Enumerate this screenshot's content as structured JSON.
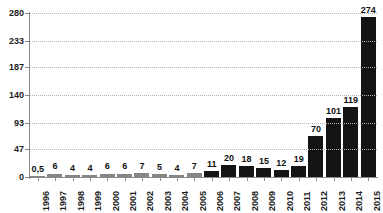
{
  "chart_data": {
    "type": "bar",
    "title": "",
    "xlabel": "",
    "ylabel": "",
    "ylim": [
      0,
      280
    ],
    "grid": true,
    "legend": "none",
    "yticks": [
      280,
      233,
      187,
      140,
      93,
      47,
      0
    ],
    "categories": [
      "1996",
      "1997",
      "1998",
      "1999",
      "2000",
      "2001",
      "2002",
      "2003",
      "2004",
      "2005",
      "2006",
      "2007",
      "2008",
      "2009",
      "2010",
      "2011",
      "2012",
      "2013",
      "2014",
      "2015"
    ],
    "values": [
      0.5,
      6,
      4,
      4,
      6,
      6,
      7,
      5,
      4,
      7,
      11,
      20,
      18,
      15,
      12,
      19,
      70,
      101,
      119,
      274
    ],
    "value_labels": [
      "0,5",
      "6",
      "4",
      "4",
      "6",
      "6",
      "7",
      "5",
      "4",
      "7",
      "11",
      "20",
      "18",
      "15",
      "12",
      "19",
      "70",
      "101",
      "119",
      "274"
    ],
    "bar_colors": [
      "#868686",
      "#868686",
      "#868686",
      "#868686",
      "#868686",
      "#868686",
      "#868686",
      "#868686",
      "#868686",
      "#868686",
      "#141414",
      "#141414",
      "#141414",
      "#141414",
      "#141414",
      "#141414",
      "#141414",
      "#141414",
      "#141414",
      "#141414"
    ],
    "colors": {
      "bar_gray": "#868686",
      "bar_black": "#141414",
      "axis": "#8a8a8a",
      "grid": "#b4b4b4",
      "text": "#1c1c1c",
      "background": "#ffffff"
    }
  },
  "title_remnant": "",
  "axis": {
    "y_labels": [
      "280",
      "233",
      "187",
      "140",
      "93",
      "47",
      "0"
    ],
    "x_labels": [
      "1996",
      "1997",
      "1998",
      "1999",
      "2000",
      "2001",
      "2002",
      "2003",
      "2004",
      "2005",
      "2006",
      "2007",
      "2008",
      "2009",
      "2010",
      "2011",
      "2012",
      "2013",
      "2014",
      "2015"
    ]
  }
}
